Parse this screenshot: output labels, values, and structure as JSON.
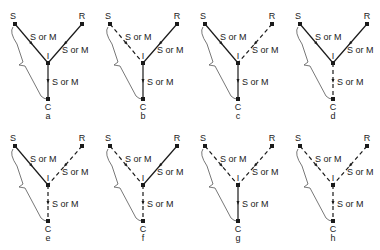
{
  "figure": {
    "edge_label": "S or M",
    "nodes": {
      "source": "S",
      "receiver": "R",
      "intermediate": "I",
      "collector": "C"
    },
    "colors": {
      "ink": "#1a1a1a",
      "bracket": "#555555"
    },
    "panels": [
      {
        "caption": "a",
        "col": 0,
        "row": 0,
        "s_i": "solid",
        "r_i": "solid",
        "i_c": "solid"
      },
      {
        "caption": "b",
        "col": 1,
        "row": 0,
        "s_i": "dashed",
        "r_i": "solid",
        "i_c": "solid"
      },
      {
        "caption": "c",
        "col": 2,
        "row": 0,
        "s_i": "solid",
        "r_i": "dashed",
        "i_c": "solid"
      },
      {
        "caption": "d",
        "col": 3,
        "row": 0,
        "s_i": "solid",
        "r_i": "solid",
        "i_c": "dashed"
      },
      {
        "caption": "e",
        "col": 0,
        "row": 1,
        "s_i": "solid",
        "r_i": "dashed",
        "i_c": "dashed"
      },
      {
        "caption": "f",
        "col": 1,
        "row": 1,
        "s_i": "dashed",
        "r_i": "solid",
        "i_c": "dashed"
      },
      {
        "caption": "g",
        "col": 2,
        "row": 1,
        "s_i": "dashed",
        "r_i": "dashed",
        "i_c": "solid"
      },
      {
        "caption": "h",
        "col": 3,
        "row": 1,
        "s_i": "dashed",
        "r_i": "dashed",
        "i_c": "dashed"
      }
    ]
  }
}
